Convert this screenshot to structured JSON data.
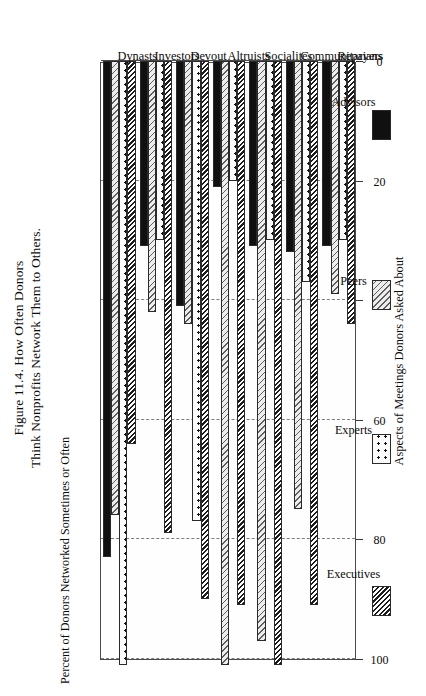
{
  "figure": {
    "title_line1": "Figure 11.4. How Often Donors",
    "title_line2": "Think Nonprofits Network Them to Others."
  },
  "chart_data": {
    "type": "bar",
    "title": "Figure 11.4. How Often Donors Think Nonprofits Network Them to Others.",
    "orientation": "horizontal-grouped",
    "xlabel": "Aspects of Meetings Donors Asked About",
    "ylabel": "Percent of Donors Networked Sometimes or Often",
    "ylim": [
      0,
      100
    ],
    "yticks": [
      0,
      20,
      40,
      60,
      80,
      100
    ],
    "ytick_labels": [
      "0",
      "20",
      "40",
      "60",
      "80",
      "100"
    ],
    "grid": true,
    "legend_position": "bottom",
    "categories": [
      "Repayers",
      "Communitarians",
      "Socialites",
      "Altruists",
      "Devout",
      "Investors",
      "Dynasts"
    ],
    "series": [
      {
        "name": "Executives",
        "pattern": "dark-diagonal-hatch",
        "values": [
          44,
          91,
          101,
          91,
          90,
          79,
          64
        ]
      },
      {
        "name": "Experts",
        "pattern": "dotted",
        "values": [
          30,
          37,
          30,
          20,
          77,
          30,
          101
        ]
      },
      {
        "name": "Peers",
        "pattern": "light-diagonal-hatch",
        "values": [
          39,
          75,
          97,
          101,
          44,
          42,
          76
        ]
      },
      {
        "name": "Advisors",
        "pattern": "solid-black",
        "values": [
          31,
          32,
          31,
          21,
          41,
          31,
          83
        ]
      }
    ]
  },
  "colors": {
    "frame": "#4a4a4a",
    "gridline": "#7d7d7d",
    "advisors": "#101010",
    "peers": "#e6e6e6",
    "experts": "#fbfbfb",
    "executives": "#f2f2f2",
    "background": "#ffffff"
  }
}
